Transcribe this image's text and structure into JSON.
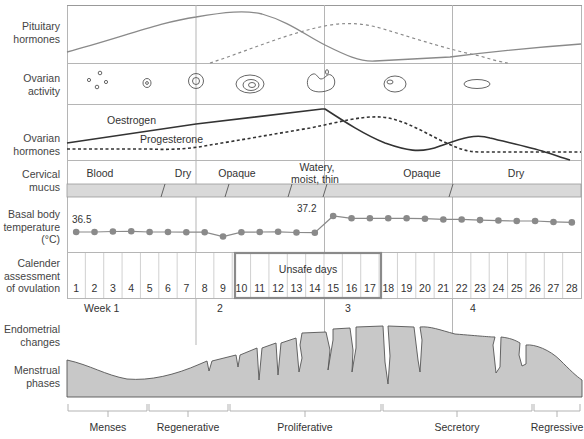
{
  "row_labels": {
    "pituitary": [
      "Pituitary",
      "hormones"
    ],
    "ovarian_activity": [
      "Ovarian",
      "activity"
    ],
    "ovarian_hormones": [
      "Ovarian",
      "hormones"
    ],
    "cervical_mucus": [
      "Cervical",
      "mucus"
    ],
    "bbt": [
      "Basal body",
      "temperature",
      "(°C)"
    ],
    "calendar": [
      "Calender",
      "assessment",
      "of ovulation"
    ],
    "endometrial": [
      "Endometrial",
      "changes"
    ],
    "menstrual": [
      "Menstrual",
      "phases"
    ]
  },
  "hormones": {
    "oestrogen_label": "Oestrogen",
    "progesterone_label": "Progesterone"
  },
  "cervical_mucus": {
    "segments": [
      "Blood",
      "Dry",
      "Opaque",
      "Watery,",
      "moist, thin",
      "Opaque",
      "Dry"
    ]
  },
  "bbt": {
    "start_label": "36.5",
    "peak_label": "37.2"
  },
  "calendar": {
    "days": [
      "1",
      "2",
      "3",
      "4",
      "5",
      "6",
      "7",
      "8",
      "9",
      "10",
      "11",
      "12",
      "13",
      "14",
      "15",
      "16",
      "17",
      "18",
      "19",
      "20",
      "21",
      "22",
      "23",
      "24",
      "25",
      "26",
      "27",
      "28"
    ],
    "unsafe_label": "Unsafe days",
    "weeks": [
      "Week 1",
      "2",
      "3",
      "4"
    ]
  },
  "phases": [
    "Menses",
    "Regenerative",
    "Proliferative",
    "Secretory",
    "Regressive"
  ],
  "colors": {
    "grid": "#b5b5b5",
    "line": "#8a8a8a",
    "dark_line": "#333333",
    "dot": "#8a8a8a",
    "band": "#d9d9d9",
    "endometrium": "#c8c8c8",
    "unsafe_box": "#8a8a8a"
  },
  "chart_data": {
    "type": "line",
    "x": [
      1,
      2,
      3,
      4,
      5,
      6,
      7,
      8,
      9,
      10,
      11,
      12,
      13,
      14,
      15,
      16,
      17,
      18,
      19,
      20,
      21,
      22,
      23,
      24,
      25,
      26,
      27,
      28
    ],
    "xlabel": "Day of cycle",
    "series": [
      {
        "name": "Basal body temperature (°C)",
        "values": [
          36.5,
          36.5,
          36.52,
          36.53,
          36.5,
          36.5,
          36.49,
          36.49,
          36.3,
          36.49,
          36.5,
          36.51,
          36.48,
          36.47,
          37.2,
          37.1,
          37.1,
          37.1,
          37.1,
          37.08,
          37.05,
          37.05,
          37.02,
          37.0,
          36.98,
          36.98,
          36.94,
          36.92
        ]
      }
    ],
    "annotations": [
      "36.5",
      "37.2",
      "Unsafe days (10–17)"
    ],
    "curves_qualitative": [
      "Pituitary hormones (FSH solid, LH dashed)",
      "Oestrogen (solid)",
      "Progesterone (dashed)"
    ],
    "ylim": [
      36.2,
      37.3
    ]
  }
}
